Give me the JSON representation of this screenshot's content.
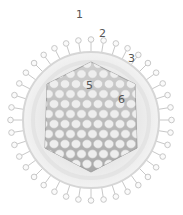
{
  "diagram": {
    "colors": {
      "envelope_fill": "#e6e6e6",
      "envelope_edge": "#d0d0d0",
      "spike": "#c8c8c8",
      "capsid_fill": "#bdbdbd",
      "capsomere": "#eeeeee",
      "label": "#555555"
    },
    "labels": [
      {
        "id": "1",
        "text": "1",
        "x": 76,
        "y": 9
      },
      {
        "id": "2",
        "text": "2",
        "x": 99,
        "y": 28
      },
      {
        "id": "3",
        "text": "3",
        "x": 128,
        "y": 53
      },
      {
        "id": "5",
        "text": "5",
        "x": 86,
        "y": 80
      },
      {
        "id": "6",
        "text": "6",
        "x": 118,
        "y": 94
      }
    ]
  }
}
